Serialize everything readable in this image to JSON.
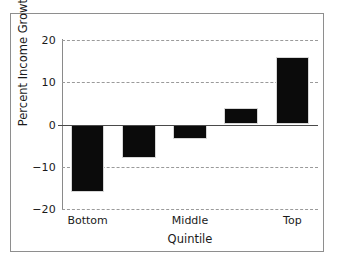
{
  "chart_data": {
    "type": "bar",
    "title": "",
    "xlabel": "Quintile",
    "ylabel": "Percent Income Growth",
    "categories": [
      "Bottom",
      "",
      "Middle",
      "",
      "Top"
    ],
    "values": [
      -16,
      -8,
      -3.5,
      4,
      16
    ],
    "ylim": [
      -20,
      20
    ],
    "yticks": [
      20,
      10,
      0,
      -10,
      -20
    ],
    "ytick_labels": [
      "20",
      "10",
      "0",
      "−10",
      "−20"
    ],
    "xtick_labels": [
      "Bottom",
      "Middle",
      "Top"
    ],
    "xtick_positions": [
      0,
      2,
      4
    ],
    "grid": "horizontal-dashed",
    "legend": "none",
    "series": [
      {
        "name": "Percent Income Growth",
        "values": [
          -16,
          -8,
          -3.5,
          4,
          16
        ]
      }
    ],
    "bar_color": "#0b0b0b",
    "grid_color": "#9a9a9a",
    "axis_color": "#8a8a8a",
    "frame_color": "#8e8e8e",
    "background_color": "#ffffff"
  }
}
